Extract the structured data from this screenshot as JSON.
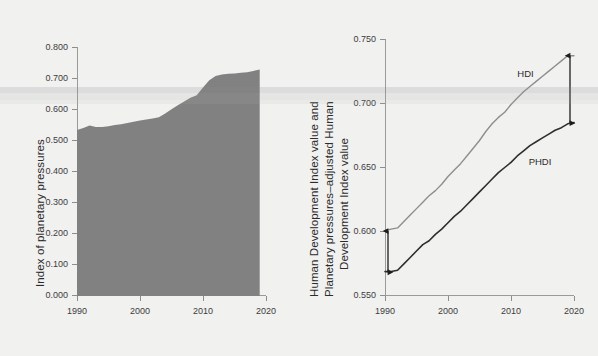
{
  "figure": {
    "background": "#f1f1f0",
    "area_fill": "#818181",
    "hdi_line_color": "#8e8e8e",
    "phdi_line_color": "#2e2e2e",
    "axis_color": "#9a9a9a"
  },
  "chart_data": [
    {
      "id": "left",
      "type": "area",
      "title": "",
      "xlabel": "",
      "ylabel": "Index of planetary pressures",
      "xlim": [
        1990,
        2020
      ],
      "ylim": [
        0.0,
        0.8
      ],
      "xticks": [
        1990,
        2000,
        2010,
        2020
      ],
      "xtick_labels": [
        "1990",
        "2000",
        "2010",
        "2020"
      ],
      "yticks": [
        0.0,
        0.1,
        0.2,
        0.3,
        0.4,
        0.5,
        0.6,
        0.7,
        0.8
      ],
      "ytick_labels": [
        "0.000",
        "0.100",
        "0.200",
        "0.300",
        "0.400",
        "0.500",
        "0.600",
        "0.700",
        "0.800"
      ],
      "grid": false,
      "legend": "none",
      "series": [
        {
          "name": "Index of planetary pressures",
          "x": [
            1990,
            1991,
            1992,
            1993,
            1994,
            1995,
            1996,
            1997,
            1998,
            1999,
            2000,
            2001,
            2002,
            2003,
            2004,
            2005,
            2006,
            2007,
            2008,
            2009,
            2010,
            2011,
            2012,
            2013,
            2014,
            2015,
            2016,
            2017,
            2018,
            2019
          ],
          "values": [
            0.533,
            0.54,
            0.548,
            0.543,
            0.543,
            0.545,
            0.549,
            0.552,
            0.556,
            0.56,
            0.564,
            0.567,
            0.57,
            0.574,
            0.586,
            0.6,
            0.613,
            0.625,
            0.637,
            0.645,
            0.67,
            0.693,
            0.707,
            0.712,
            0.714,
            0.715,
            0.717,
            0.719,
            0.723,
            0.728
          ]
        }
      ]
    },
    {
      "id": "right",
      "type": "line",
      "title": "",
      "xlabel": "",
      "ylabel": "Human Development Index value and Planetary pressures–adjusted Human Development Index value",
      "xlim": [
        1990,
        2020
      ],
      "ylim": [
        0.55,
        0.75
      ],
      "xticks": [
        1990,
        2000,
        2010,
        2020
      ],
      "xtick_labels": [
        "1990",
        "2000",
        "2010",
        "2020"
      ],
      "yticks": [
        0.55,
        0.6,
        0.65,
        0.7,
        0.75
      ],
      "ytick_labels": [
        "0.550",
        "0.600",
        "0.650",
        "0.700",
        "0.750"
      ],
      "grid": false,
      "legend": "inline-annotations",
      "annotations": [
        {
          "text": "HDI",
          "x": 2011.0,
          "y": 0.7225
        },
        {
          "text": "PHDI",
          "x": 2012.8,
          "y": 0.6545
        },
        {
          "text": "gap-arrow-1990",
          "x": 1990,
          "y0": 0.5685,
          "y1": 0.6005
        },
        {
          "text": "gap-arrow-2020",
          "x": 2020,
          "y0": 0.6845,
          "y1": 0.737
        }
      ],
      "series": [
        {
          "name": "HDI",
          "x": [
            1990,
            1991,
            1992,
            1993,
            1994,
            1995,
            1996,
            1997,
            1998,
            1999,
            2000,
            2001,
            2002,
            2003,
            2004,
            2005,
            2006,
            2007,
            2008,
            2009,
            2010,
            2011,
            2012,
            2013,
            2014,
            2015,
            2016,
            2017,
            2018,
            2019,
            2020
          ],
          "values": [
            0.601,
            0.602,
            0.603,
            0.608,
            0.613,
            0.618,
            0.623,
            0.628,
            0.632,
            0.637,
            0.643,
            0.648,
            0.653,
            0.659,
            0.665,
            0.671,
            0.678,
            0.684,
            0.689,
            0.693,
            0.699,
            0.704,
            0.709,
            0.713,
            0.717,
            0.721,
            0.725,
            0.729,
            0.733,
            0.737,
            0.737
          ]
        },
        {
          "name": "PHDI",
          "x": [
            1990,
            1991,
            1992,
            1993,
            1994,
            1995,
            1996,
            1997,
            1998,
            1999,
            2000,
            2001,
            2002,
            2003,
            2004,
            2005,
            2006,
            2007,
            2008,
            2009,
            2010,
            2011,
            2012,
            2013,
            2014,
            2015,
            2016,
            2017,
            2018,
            2019,
            2020
          ],
          "values": [
            0.569,
            0.569,
            0.57,
            0.575,
            0.58,
            0.585,
            0.59,
            0.593,
            0.598,
            0.602,
            0.607,
            0.612,
            0.616,
            0.621,
            0.626,
            0.631,
            0.636,
            0.641,
            0.646,
            0.65,
            0.654,
            0.659,
            0.663,
            0.667,
            0.67,
            0.673,
            0.676,
            0.679,
            0.681,
            0.684,
            0.685
          ]
        }
      ]
    }
  ]
}
